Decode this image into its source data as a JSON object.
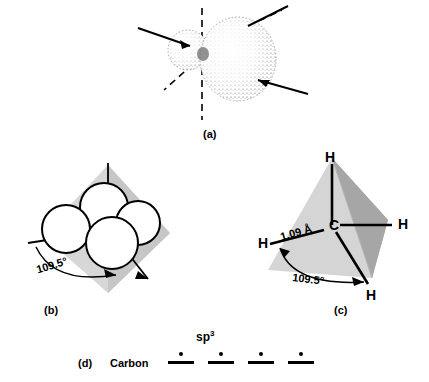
{
  "figure": {
    "background": "#ffffff",
    "ink": "#000000",
    "tetra_face_light": "#d9d9d9",
    "tetra_face_mid": "#c4c4c4",
    "tetra_face_dark": "#9e9e9e",
    "stipple_color": "#555555"
  },
  "panels": {
    "a": {
      "caption": "(a)",
      "description": "single sp3 hybrid orbital with small back lobe and large front lobe",
      "lobes": [
        {
          "name": "back-lobe",
          "kind": "small"
        },
        {
          "name": "front-lobe",
          "kind": "large"
        }
      ],
      "axes": [
        {
          "name": "dashed-vertical-axis",
          "style": "dashed"
        },
        {
          "name": "dashed-diagonal-axis",
          "style": "dashed"
        },
        {
          "name": "solid-upper-left-axis",
          "style": "solid"
        },
        {
          "name": "solid-upper-right-axis",
          "style": "solid"
        },
        {
          "name": "solid-right-axis",
          "style": "solid"
        }
      ]
    },
    "b": {
      "caption": "(b)",
      "description": "four sp3 orbitals arranged in a tetrahedron",
      "angle_label": "109.5°",
      "lobe_count": 4
    },
    "c": {
      "caption": "(c)",
      "description": "methane tetrahedron with carbon at center",
      "center_atom": "C",
      "hydrogens": [
        "H",
        "H",
        "H",
        "H"
      ],
      "bond_length_label": "1.09 Å",
      "angle_label": "109.5°"
    },
    "d": {
      "caption": "(d)",
      "element_label": "Carbon",
      "shell_label_base": "sp",
      "shell_label_exponent": "3",
      "orbitals": [
        {
          "name": "sp3-orbital-1",
          "electrons": 1
        },
        {
          "name": "sp3-orbital-2",
          "electrons": 1
        },
        {
          "name": "sp3-orbital-3",
          "electrons": 1
        },
        {
          "name": "sp3-orbital-4",
          "electrons": 1
        }
      ]
    }
  }
}
